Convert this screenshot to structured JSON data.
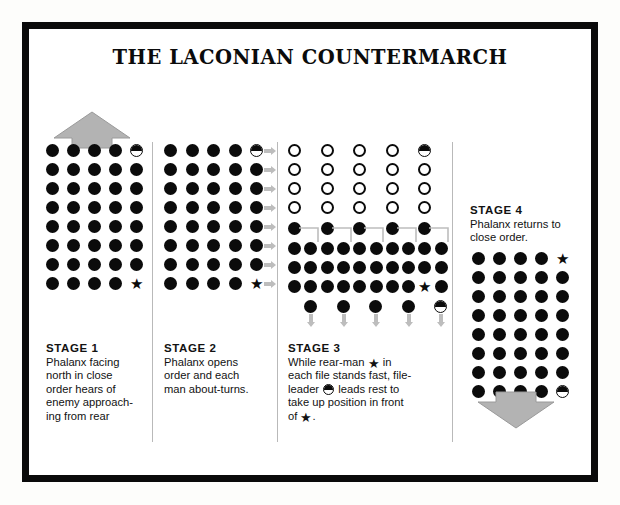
{
  "title": "THE LACONIAN COUNTERMARCH",
  "colors": {
    "ink": "#0b0b0b",
    "arrow_grey": "#b3b3b3",
    "arrow_grey_edge": "#8f8f8f",
    "divider": "#b9b9b9",
    "paper": "#ffffff"
  },
  "legend": {
    "filled_circle": "hoplite",
    "open_circle": "hoplite-open-order",
    "half_circle": "file-leader",
    "star": "rear-man"
  },
  "stages": [
    {
      "id": "stage-1",
      "heading": "STAGE  1",
      "body": "Phalanx facing north in close order hears of enemy approaching from rear",
      "body_lines": [
        "Phalanx facing",
        "north in close",
        "order hears of",
        "enemy approach-",
        "ing from rear"
      ],
      "grid": {
        "cols": 5,
        "rows": 8
      },
      "file_leader_cell": {
        "col": 4,
        "row": 0
      },
      "rear_man_cell": {
        "col": 4,
        "row": 7
      },
      "arrow": {
        "direction": "up",
        "label": "north-arrow"
      }
    },
    {
      "id": "stage-2",
      "heading": "STAGE  2",
      "body": "Phalanx opens order and each man about-turns.",
      "body_lines": [
        "Phalanx opens",
        "order and each",
        "man about-turns."
      ],
      "grid": {
        "cols": 5,
        "rows": 8
      },
      "file_leader_cell": {
        "col": 4,
        "row": 0
      },
      "rear_man_cell": {
        "col": 4,
        "row": 7
      },
      "row_arrows": 8,
      "row_arrow_direction": "right"
    },
    {
      "id": "stage-3",
      "heading": "STAGE  3",
      "body": "While rear-man ★ in each file stands fast, file-leader ◖ leads rest to take up position in front of ★.",
      "body_lines_parts": [
        [
          "While rear-man ",
          "star",
          " in"
        ],
        [
          "each file stands fast, file-"
        ],
        [
          "leader ",
          "half",
          " leads rest to"
        ],
        [
          "take up position in front"
        ],
        [
          "of ",
          "star",
          "."
        ]
      ],
      "open_grid": {
        "cols": 5,
        "rows": 4
      },
      "open_file_leader_cell": {
        "col": 4,
        "row": 0
      },
      "transition_row": {
        "count": 5,
        "bracket": true
      },
      "dense_rows": {
        "count": 3,
        "per_row": 10
      },
      "dense_rear_man_cell": {
        "col": 8,
        "row": 2
      },
      "bottom_row": {
        "count": 5,
        "half_at": 4,
        "arrow_direction": "down"
      }
    },
    {
      "id": "stage-4",
      "heading": "STAGE  4",
      "body": "Phalanx returns to close order.",
      "body_lines": [
        "Phalanx returns to",
        "close order."
      ],
      "grid": {
        "cols": 5,
        "rows": 8
      },
      "rear_man_cell": {
        "col": 4,
        "row": 0
      },
      "file_leader_cell": {
        "col": 4,
        "row": 7
      },
      "arrow": {
        "direction": "down",
        "label": "south-arrow"
      }
    }
  ]
}
